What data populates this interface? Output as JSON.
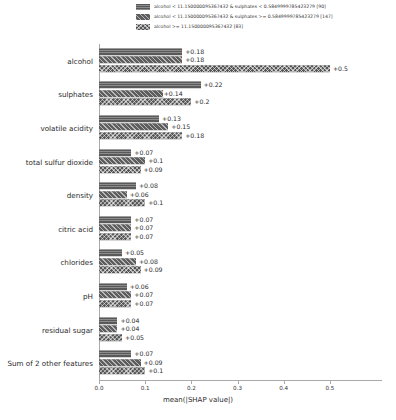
{
  "chart_data": {
    "type": "bar",
    "title": "",
    "xlabel": "mean(|SHAP value|)",
    "ylabel": "",
    "xlim": [
      0.0,
      0.55
    ],
    "xticks": [
      "0.0",
      "0.1",
      "0.2",
      "0.3",
      "0.4",
      "0.5"
    ],
    "xtick_values": [
      0.0,
      0.1,
      0.2,
      0.3,
      0.4,
      0.5
    ],
    "grid": false,
    "orientation": "horizontal",
    "legend_position": "top",
    "categories": [
      "alcohol",
      "sulphates",
      "volatile acidity",
      "total sulfur dioxide",
      "density",
      "citric acid",
      "chlorides",
      "pH",
      "residual sugar",
      "Sum of 2 other features"
    ],
    "series": [
      {
        "name": "alcohol < 11.150000095367432 & sulphates < 0.5849999785423279 [90]",
        "count": 90,
        "fill": "f0",
        "color": "#595959",
        "values": [
          0.18,
          0.22,
          0.13,
          0.07,
          0.08,
          0.07,
          0.05,
          0.06,
          0.04,
          0.07
        ],
        "labels": [
          "+0.18",
          "+0.22",
          "+0.13",
          "+0.07",
          "+0.08",
          "+0.07",
          "+0.05",
          "+0.06",
          "+0.04",
          "+0.07"
        ]
      },
      {
        "name": "alcohol < 11.150000095367432 & sulphates >= 0.5849999785423279 [147]",
        "count": 147,
        "fill": "f1",
        "color": "#5e5e5e",
        "values": [
          0.18,
          0.14,
          0.15,
          0.1,
          0.06,
          0.07,
          0.08,
          0.07,
          0.04,
          0.09
        ],
        "labels": [
          "+0.18",
          "+0.14",
          "+0.15",
          "+0.1",
          "+0.06",
          "+0.07",
          "+0.08",
          "+0.07",
          "+0.04",
          "+0.09"
        ]
      },
      {
        "name": "alcohol >= 11.150000095367432 [83]",
        "count": 83,
        "fill": "f2",
        "color": "#555555",
        "values": [
          0.5,
          0.2,
          0.18,
          0.09,
          0.1,
          0.07,
          0.09,
          0.07,
          0.05,
          0.1
        ],
        "labels": [
          "+0.5",
          "+0.2",
          "+0.18",
          "+0.09",
          "+0.1",
          "+0.07",
          "+0.09",
          "+0.07",
          "+0.05",
          "+0.1"
        ]
      }
    ]
  }
}
